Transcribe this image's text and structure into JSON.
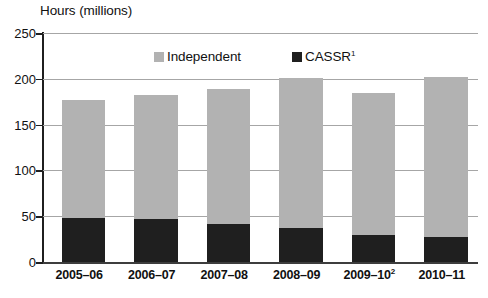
{
  "chart_data": {
    "type": "bar",
    "subtype": "stacked-vertical",
    "title": "Hours (millions)",
    "xlabel": "",
    "ylabel": "Hours (millions)",
    "ylim": [
      0,
      250
    ],
    "yticks": [
      0,
      50,
      100,
      150,
      200,
      250
    ],
    "ytick_labels": [
      "0",
      "50",
      "100",
      "150",
      "200",
      "250"
    ],
    "grid": true,
    "grid_axis": "y",
    "legend_position": "inside-top-center",
    "categories": [
      "2005–06",
      "2006–07",
      "2007–08",
      "2008–09",
      "2009–10",
      "2010–11"
    ],
    "category_labels": [
      {
        "text": "2005–06",
        "sup": ""
      },
      {
        "text": "2006–07",
        "sup": ""
      },
      {
        "text": "2007–08",
        "sup": ""
      },
      {
        "text": "2008–09",
        "sup": ""
      },
      {
        "text": "2009–10",
        "sup": "2"
      },
      {
        "text": "2010–11",
        "sup": ""
      }
    ],
    "series": [
      {
        "name": "CASSR",
        "name_sup": "1",
        "color": "#1f1f1f",
        "stack_order": 0,
        "values": [
          48,
          47,
          42,
          37,
          29,
          27
        ]
      },
      {
        "name": "Independent",
        "name_sup": "",
        "color": "#b2b2b2",
        "stack_order": 1,
        "values": [
          129,
          135,
          147,
          164,
          156,
          175
        ]
      }
    ],
    "totals": [
      177,
      182,
      189,
      201,
      185,
      202
    ]
  },
  "colors": {
    "independent": "#b2b2b2",
    "cassr": "#1f1f1f",
    "gridline": "#a6a6a6",
    "axis": "#1f1f1f",
    "baseline": "#3d3d3d",
    "background": "#ffffff",
    "text": "#111111"
  },
  "legend": {
    "entries": [
      {
        "label": "Independent",
        "sup": "",
        "swatch": "#b2b2b2"
      },
      {
        "label": "CASSR",
        "sup": "1",
        "swatch": "#1f1f1f"
      }
    ]
  }
}
